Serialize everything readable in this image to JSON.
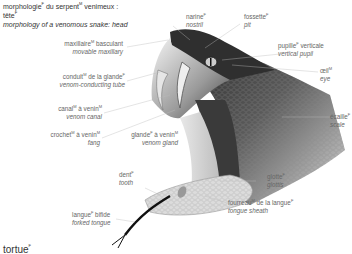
{
  "title": {
    "fr_line1": "morphologie",
    "fr_line1_sup": "F",
    "fr_line1b": " du serpent",
    "fr_line1b_sup": "M",
    "fr_line1c": " venimeux :",
    "fr_line2": "tête",
    "fr_line2_sup": "F",
    "en": "morphology of a venomous snake: head"
  },
  "labels": [
    {
      "id": "movable-maxillary",
      "fr": "maxillaire",
      "g": "M",
      "fr2": " basculant",
      "en": "movable maxillary"
    },
    {
      "id": "venom-conducting-tube",
      "fr": "conduit",
      "g": "M",
      "fr2": " de la glande",
      "g2": "F",
      "en": "venom-conducting tube"
    },
    {
      "id": "venom-canal",
      "fr": "canal",
      "g": "M",
      "fr2": " à venin",
      "g2": "M",
      "en": "venom canal"
    },
    {
      "id": "fang",
      "fr": "crochet",
      "g": "M",
      "fr2": " à venin",
      "g2": "M",
      "en": "fang"
    },
    {
      "id": "venom-gland",
      "fr": "glande",
      "g": "F",
      "fr2": " à venin",
      "g2": "M",
      "en": "venom gland"
    },
    {
      "id": "nostril",
      "fr": "narine",
      "g": "F",
      "en": "nostril"
    },
    {
      "id": "pit",
      "fr": "fossette",
      "g": "F",
      "en": "pit"
    },
    {
      "id": "vertical-pupil",
      "fr": "pupille",
      "g": "F",
      "fr2": " verticale",
      "en": "vertical pupil"
    },
    {
      "id": "eye",
      "fr": "œil",
      "g": "M",
      "en": "eye"
    },
    {
      "id": "scale",
      "fr": "écaille",
      "g": "F",
      "en": "scale"
    },
    {
      "id": "tooth",
      "fr": "dent",
      "g": "F",
      "en": "tooth"
    },
    {
      "id": "glottis",
      "fr": "glotte",
      "g": "F",
      "en": "glottis"
    },
    {
      "id": "tongue-sheath",
      "fr": "fourreau",
      "g": "M",
      "fr2": " de la langue",
      "g2": "F",
      "en": "tongue sheath"
    },
    {
      "id": "forked-tongue",
      "fr": "langue",
      "g": "F",
      "fr2": " bifide",
      "en": "forked tongue"
    }
  ],
  "footer": {
    "text": "tortue",
    "sup": "F"
  }
}
